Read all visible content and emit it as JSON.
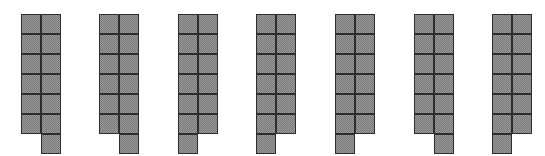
{
  "diagram": {
    "cell_size_px": 20,
    "columns": 2,
    "rows": 6,
    "fill_color": "#9a9a9a",
    "border_color": "#2e2e2e",
    "figures": [
      {
        "index": 1,
        "x": 21,
        "extra_tile": "right"
      },
      {
        "index": 2,
        "x": 99,
        "extra_tile": "right"
      },
      {
        "index": 3,
        "x": 178,
        "extra_tile": "left"
      },
      {
        "index": 4,
        "x": 256,
        "extra_tile": "left"
      },
      {
        "index": 5,
        "x": 335,
        "extra_tile": "left"
      },
      {
        "index": 6,
        "x": 414,
        "extra_tile": "right"
      },
      {
        "index": 7,
        "x": 492,
        "extra_tile": "left"
      }
    ]
  }
}
